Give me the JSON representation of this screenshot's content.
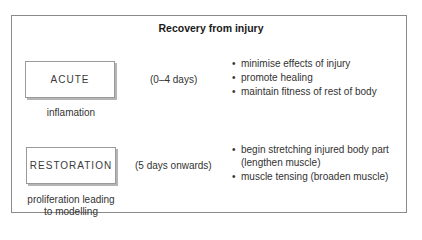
{
  "diagram": {
    "title": "Recovery from injury",
    "stages": [
      {
        "name": "ACUTE",
        "caption": "inflamation",
        "duration": "(0–4 days)",
        "goals": [
          "minimise effects of injury",
          "promote healing",
          "maintain fitness of rest of body"
        ]
      },
      {
        "name": "RESTORATION",
        "caption_lines": [
          "proliferation leading",
          "to modelling"
        ],
        "duration": "(5 days onwards)",
        "goals": [
          "begin stretching injured body part (lengthen muscle)",
          "muscle tensing (broaden muscle)"
        ]
      }
    ]
  }
}
